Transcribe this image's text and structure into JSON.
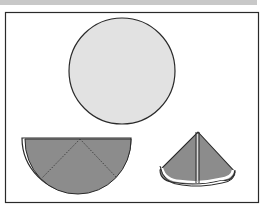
{
  "diagram": {
    "colors": {
      "frame": "#2a2a2a",
      "circle_fill": "#e0e0e0",
      "folded_fill": "#8c8c8c",
      "top_bar": "#c8c8c8"
    },
    "steps": [
      {
        "id": "circle",
        "label": ""
      },
      {
        "id": "semicircle",
        "label": ""
      },
      {
        "id": "cone",
        "label": ""
      }
    ]
  }
}
